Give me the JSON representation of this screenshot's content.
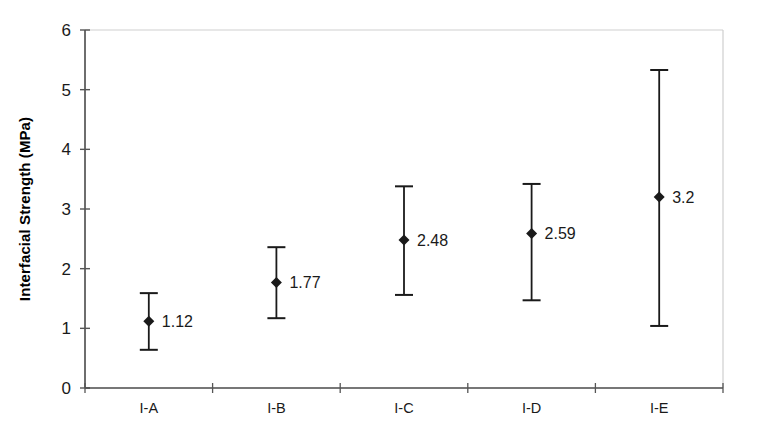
{
  "chart_data": {
    "type": "scatter",
    "title": "",
    "xlabel": "",
    "ylabel": "Interfacial Strength (MPa)",
    "categories": [
      "I-A",
      "I-B",
      "I-C",
      "I-D",
      "I-E"
    ],
    "values": [
      1.12,
      1.77,
      2.48,
      2.59,
      3.2
    ],
    "data_labels": [
      "1.12",
      "1.77",
      "2.48",
      "2.59",
      "3.2"
    ],
    "error_bars": {
      "upper": [
        1.59,
        2.36,
        3.38,
        3.42,
        5.33
      ],
      "lower": [
        0.64,
        1.17,
        1.56,
        1.47,
        1.04
      ]
    },
    "ylim": [
      0,
      6
    ],
    "yticks": [
      0,
      1,
      2,
      3,
      4,
      5,
      6
    ],
    "ytick_labels": [
      "0",
      "1",
      "2",
      "3",
      "4",
      "5",
      "6"
    ],
    "grid": false,
    "legend": false,
    "marker": "diamond",
    "series_color": "#1a1a1a",
    "axis_color": "#555555",
    "frame_color": "#cccccc",
    "background": "#ffffff"
  },
  "axis": {
    "y_title": "Interfacial Strength (MPa)"
  }
}
